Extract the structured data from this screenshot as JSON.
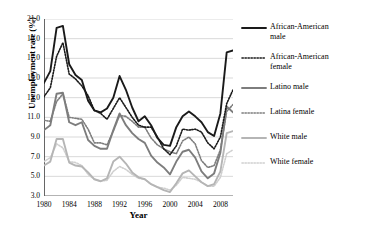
{
  "chart_data": {
    "type": "line",
    "title": "",
    "xlabel": "Year",
    "ylabel": "Unemployment rate (%)",
    "xlim": [
      1980,
      2010
    ],
    "ylim": [
      3.0,
      21.0
    ],
    "grid": "horizontal",
    "legend_position": "right",
    "ytick_labels": [
      "3.0",
      "5.0",
      "7.0",
      "9.0",
      "11.0",
      "13.0",
      "15.0",
      "17.0",
      "19.0",
      "21.0"
    ],
    "ytick_values": [
      3.0,
      5.0,
      7.0,
      9.0,
      11.0,
      13.0,
      15.0,
      17.0,
      19.0,
      21.0
    ],
    "xtick_labels": [
      "1980",
      "1984",
      "1988",
      "1992",
      "1996",
      "2000",
      "2004",
      "2008"
    ],
    "xtick_values": [
      1980,
      1984,
      1988,
      1992,
      1996,
      2000,
      2004,
      2008
    ],
    "x": [
      1980,
      1981,
      1982,
      1983,
      1984,
      1985,
      1986,
      1987,
      1988,
      1989,
      1990,
      1991,
      1992,
      1993,
      1994,
      1995,
      1996,
      1997,
      1998,
      1999,
      2000,
      2001,
      2002,
      2003,
      2004,
      2005,
      2006,
      2007,
      2008,
      2009,
      2010
    ],
    "series": [
      {
        "name": "African-American male",
        "color": "#1a1a1a",
        "style": "solid",
        "width": 1.9,
        "values": [
          14.5,
          15.7,
          20.1,
          20.3,
          16.4,
          15.3,
          14.8,
          12.7,
          11.7,
          11.5,
          11.9,
          13.0,
          15.2,
          13.8,
          12.0,
          10.6,
          11.1,
          10.2,
          8.9,
          8.2,
          8.1,
          10.0,
          11.1,
          11.6,
          11.1,
          10.5,
          9.5,
          9.1,
          11.4,
          17.6,
          17.8
        ]
      },
      {
        "name": "African-American female",
        "color": "#1a1a1a",
        "style": "dotted",
        "width": 1.6,
        "values": [
          13.1,
          14.0,
          17.2,
          18.6,
          15.4,
          14.9,
          14.2,
          13.2,
          11.7,
          11.4,
          10.8,
          11.9,
          13.0,
          12.0,
          11.0,
          10.2,
          10.0,
          10.0,
          9.0,
          7.8,
          7.2,
          8.1,
          9.8,
          9.7,
          9.8,
          9.5,
          8.4,
          7.8,
          9.0,
          12.4,
          13.8
        ]
      },
      {
        "name": "Latino male",
        "color": "#7d7d7d",
        "style": "solid",
        "width": 1.9,
        "values": [
          9.7,
          10.2,
          13.4,
          13.5,
          10.5,
          10.2,
          10.5,
          8.7,
          8.1,
          7.8,
          7.8,
          9.7,
          11.4,
          10.2,
          9.4,
          8.8,
          8.4,
          7.1,
          6.4,
          5.9,
          5.2,
          6.5,
          7.5,
          7.7,
          6.9,
          5.5,
          4.8,
          5.3,
          7.4,
          12.1,
          11.5
        ]
      },
      {
        "name": "Latina female",
        "color": "#7d7d7d",
        "style": "dotted",
        "width": 1.6,
        "values": [
          10.7,
          10.6,
          12.6,
          13.4,
          11.0,
          10.9,
          10.8,
          9.8,
          8.4,
          8.4,
          8.2,
          9.6,
          11.2,
          11.1,
          10.6,
          10.0,
          10.0,
          8.9,
          8.2,
          7.8,
          7.5,
          7.3,
          8.6,
          9.0,
          8.3,
          6.6,
          5.9,
          6.1,
          7.7,
          11.6,
          12.3
        ]
      },
      {
        "name": "White male",
        "color": "#b5b5b5",
        "style": "solid",
        "width": 1.9,
        "values": [
          6.1,
          6.5,
          8.8,
          8.8,
          6.4,
          6.1,
          6.0,
          5.4,
          4.7,
          4.5,
          4.8,
          6.5,
          7.0,
          6.3,
          5.4,
          4.9,
          4.7,
          4.2,
          3.9,
          3.6,
          3.4,
          4.3,
          5.3,
          5.6,
          5.0,
          4.4,
          4.0,
          4.2,
          5.5,
          9.4,
          9.6
        ]
      },
      {
        "name": "White female",
        "color": "#cfcfcf",
        "style": "dotted",
        "width": 1.6,
        "values": [
          6.5,
          6.9,
          8.3,
          7.9,
          6.5,
          6.4,
          6.1,
          5.2,
          4.7,
          4.5,
          4.6,
          5.5,
          6.0,
          5.7,
          5.2,
          4.8,
          4.7,
          4.2,
          3.9,
          3.8,
          3.6,
          4.1,
          4.9,
          4.8,
          4.7,
          4.4,
          4.0,
          4.0,
          4.9,
          7.3,
          7.7
        ]
      }
    ],
    "legend_entries": [
      {
        "label": "African-American\nmale",
        "color": "#1a1a1a",
        "style": "solid"
      },
      {
        "label": "African-American\nfemale",
        "color": "#1a1a1a",
        "style": "dotted"
      },
      {
        "label": "Latino male",
        "color": "#7d7d7d",
        "style": "solid"
      },
      {
        "label": "Latina female",
        "color": "#7d7d7d",
        "style": "dotted"
      },
      {
        "label": "White male",
        "color": "#b5b5b5",
        "style": "solid"
      },
      {
        "label": "White female",
        "color": "#cfcfcf",
        "style": "dotted"
      }
    ]
  }
}
